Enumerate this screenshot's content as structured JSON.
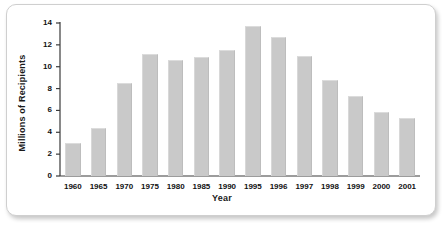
{
  "chart_data": {
    "type": "bar",
    "title": "",
    "xlabel": "Year",
    "ylabel": "Millions of Recipients",
    "categories": [
      "1960",
      "1965",
      "1970",
      "1975",
      "1980",
      "1985",
      "1990",
      "1995",
      "1996",
      "1997",
      "1998",
      "1999",
      "2000",
      "2001"
    ],
    "values": [
      3.0,
      4.4,
      8.5,
      11.2,
      10.65,
      10.85,
      11.5,
      13.7,
      12.7,
      11.0,
      8.8,
      7.3,
      5.9,
      5.3
    ],
    "ylim": [
      0,
      14
    ],
    "ytick_labels": [
      "0",
      "2",
      "4",
      "6",
      "8",
      "10",
      "12",
      "14"
    ],
    "ytick_values": [
      0,
      2,
      4,
      6,
      8,
      10,
      12,
      14
    ],
    "grid": false,
    "legend": "none",
    "bar_color": "#c9c9c9",
    "axis_color": "#3a3a3a",
    "text_color": "#111111"
  }
}
